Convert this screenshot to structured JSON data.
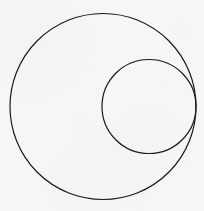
{
  "figure": {
    "background_color": "#f8f7f5",
    "stroke_color": "#1a1a1a",
    "width": 204,
    "height": 211
  },
  "chart_data": {
    "type": "diagram",
    "subtitle": "",
    "xlabel": "",
    "ylabel": "",
    "grid": false,
    "legend_position": "none",
    "axis_visible": false,
    "tick_labels": [],
    "annotations": [],
    "coordinate_system": "pixel, origin top-left, y increases downward",
    "xlim": [
      0,
      204
    ],
    "ylim": [
      0,
      211
    ],
    "shapes": [
      {
        "name": "outer-circle",
        "type": "circle",
        "cx": 103,
        "cy": 106.5,
        "r": 93,
        "diameter": 186,
        "fill": "none",
        "stroke": "#1a1a1a",
        "stroke_width": 1.2,
        "bbox": [
          10,
          13.5,
          196,
          199.5
        ]
      },
      {
        "name": "inner-circle",
        "type": "circle",
        "cx": 149,
        "cy": 106.5,
        "r": 47,
        "diameter": 94,
        "fill": "none",
        "stroke": "#1a1a1a",
        "stroke_width": 1.2,
        "bbox": [
          102,
          59.5,
          196,
          153.5
        ]
      }
    ],
    "relations": [
      {
        "name": "internal-tangency",
        "kind": "internally tangent",
        "between": [
          "outer-circle",
          "inner-circle"
        ],
        "point": [
          196,
          106.5
        ],
        "center_distance": 46,
        "radius_difference": 46
      }
    ]
  }
}
